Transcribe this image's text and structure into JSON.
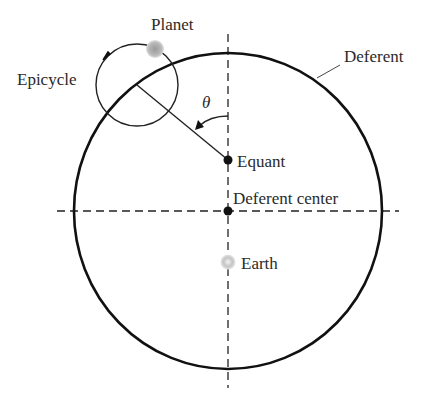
{
  "labels": {
    "planet": "Planet",
    "epicycle": "Epicycle",
    "deferent": "Deferent",
    "theta": "θ",
    "equant": "Equant",
    "deferent_center": "Deferent center",
    "earth": "Earth"
  },
  "geometry": {
    "deferent_center": [
      228,
      211
    ],
    "deferent_radius": [
      154,
      158
    ],
    "equant": [
      228,
      160
    ],
    "earth": [
      228,
      262
    ],
    "epicycle_center": [
      137,
      85
    ],
    "epicycle_radius": 41,
    "planet": [
      155,
      48
    ]
  },
  "colors": {
    "line": "#111111",
    "planet_fill": "#b0b0b0",
    "earth_fill": "#c8c8c8",
    "text": "#2a2a2a"
  }
}
